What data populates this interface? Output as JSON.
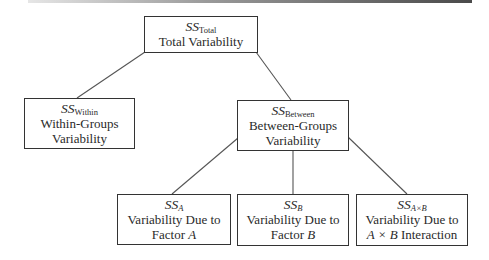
{
  "diagram": {
    "type": "tree",
    "nodes": {
      "total": {
        "symbol": "SS",
        "subscript": "Total",
        "line1": "Total Variability"
      },
      "within": {
        "symbol": "SS",
        "subscript": "Within",
        "line1": "Within-Groups",
        "line2": "Variability"
      },
      "between": {
        "symbol": "SS",
        "subscript": "Between",
        "line1": "Between-Groups",
        "line2": "Variability"
      },
      "factor_a": {
        "symbol": "SS",
        "subscript": "A",
        "line1": "Variability Due to",
        "line2_prefix": "Factor ",
        "line2_var": "A"
      },
      "factor_b": {
        "symbol": "SS",
        "subscript": "B",
        "line1": "Variability Due to",
        "line2_prefix": "Factor ",
        "line2_var": "B"
      },
      "interaction": {
        "symbol": "SS",
        "subscript": "A×B",
        "line1": "Variability Due to",
        "line2_var": "A × B",
        "line2_suffix": " Interaction"
      }
    },
    "edges": [
      [
        "total",
        "within"
      ],
      [
        "total",
        "between"
      ],
      [
        "between",
        "factor_a"
      ],
      [
        "between",
        "factor_b"
      ],
      [
        "between",
        "interaction"
      ]
    ],
    "colors": {
      "border": "#333333",
      "line": "#555555",
      "text": "#2a2a2a",
      "background": "#ffffff"
    }
  }
}
